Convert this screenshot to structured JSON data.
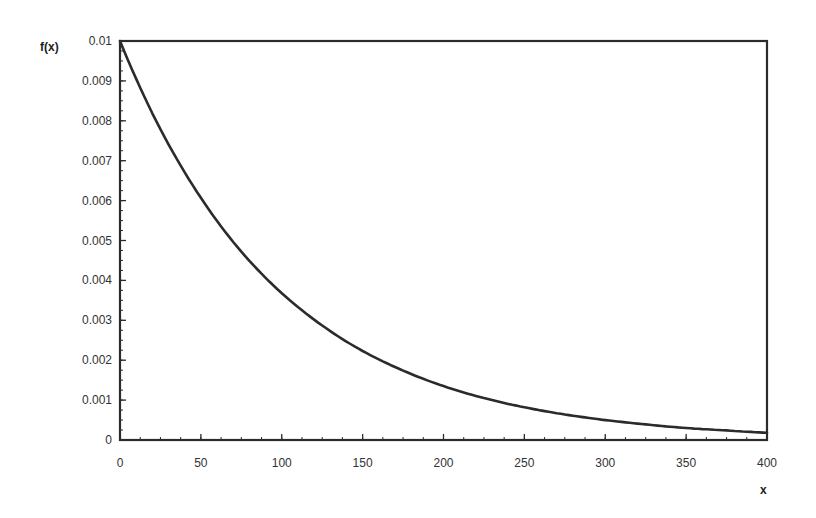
{
  "chart_data": {
    "type": "line",
    "title": "",
    "xlabel": "x",
    "ylabel": "f(x)",
    "xlim": [
      0,
      400
    ],
    "ylim": [
      0,
      0.01
    ],
    "x_ticks": [
      0,
      50,
      100,
      150,
      200,
      250,
      300,
      350,
      400
    ],
    "x_tick_labels": [
      "0",
      "50",
      "100",
      "150",
      "200",
      "250",
      "300",
      "350",
      "400"
    ],
    "y_ticks": [
      0,
      0.001,
      0.002,
      0.003,
      0.004,
      0.005,
      0.006,
      0.007,
      0.008,
      0.009,
      0.01
    ],
    "y_tick_labels": [
      "0",
      "0.001",
      "0.002",
      "0.003",
      "0.004",
      "0.005",
      "0.006",
      "0.007",
      "0.008",
      "0.009",
      "0.01"
    ],
    "grid": false,
    "legend": null,
    "series": [
      {
        "name": "f(x)",
        "description": "exponential density f(x) = 0.01 * exp(-x/100)",
        "x": [
          0,
          25,
          50,
          75,
          100,
          125,
          150,
          175,
          200,
          225,
          250,
          275,
          300,
          325,
          350,
          375,
          400
        ],
        "values": [
          0.01,
          0.00779,
          0.00607,
          0.00472,
          0.00368,
          0.00287,
          0.00223,
          0.00174,
          0.00135,
          0.00105,
          0.00082,
          0.00064,
          0.0005,
          0.00039,
          0.0003,
          0.00024,
          0.00018
        ]
      }
    ]
  },
  "labels": {
    "y_axis": "f(x)",
    "x_axis": "x"
  },
  "style": {
    "line_color": "#2b2b2b",
    "frame_color": "#2b2b2b",
    "background": "#ffffff"
  }
}
